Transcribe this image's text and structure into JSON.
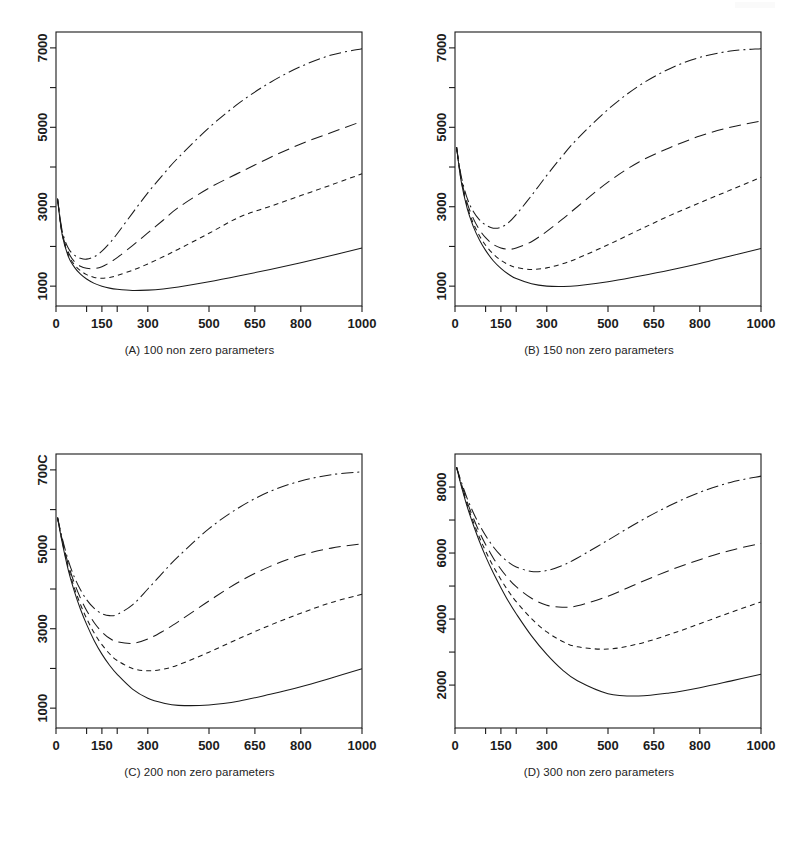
{
  "figure": {
    "title": "",
    "panel_count": 4,
    "background_color": "#ffffff",
    "line_color": "#1a1a1a"
  },
  "captions": {
    "a": "(A) 100 non zero parameters",
    "b": "(B) 150 non zero parameters",
    "c": "(C) 200 non zero parameters",
    "d": "(D) 300 non zero parameters"
  },
  "chart_data": [
    {
      "id": "panel-a",
      "type": "line",
      "title": "(A) 100 non zero parameters",
      "xlabel": "",
      "ylabel": "",
      "xlim": [
        0,
        1000
      ],
      "ylim": [
        500,
        7400
      ],
      "grid": false,
      "legend": "none",
      "xticks": [
        0,
        100,
        150,
        200,
        300,
        500,
        650,
        800,
        1000
      ],
      "xtick_labels": [
        "0",
        "",
        "150",
        "",
        "300",
        "500",
        "650",
        "800",
        "1000"
      ],
      "yticks": [
        1000,
        2000,
        3000,
        4000,
        5000,
        6000,
        7000
      ],
      "ytick_labels": [
        "1000",
        "",
        "3000",
        "",
        "5000",
        "",
        "7000"
      ],
      "series": [
        {
          "name": "solid",
          "style": "solid",
          "x": [
            5,
            20,
            40,
            60,
            80,
            100,
            125,
            150,
            175,
            200,
            250,
            300,
            350,
            400,
            500,
            600,
            700,
            800,
            900,
            1000
          ],
          "y": [
            3200,
            2300,
            1750,
            1480,
            1300,
            1180,
            1070,
            1000,
            950,
            920,
            890,
            900,
            930,
            980,
            1110,
            1260,
            1420,
            1590,
            1770,
            1960
          ]
        },
        {
          "name": "short-dash",
          "style": "short-dash",
          "x": [
            5,
            20,
            40,
            60,
            80,
            100,
            125,
            150,
            175,
            200,
            250,
            300,
            350,
            400,
            500,
            600,
            700,
            800,
            900,
            1000
          ],
          "y": [
            3200,
            2320,
            1800,
            1540,
            1390,
            1290,
            1220,
            1200,
            1220,
            1270,
            1400,
            1560,
            1740,
            1930,
            2330,
            2740,
            3010,
            3280,
            3550,
            3830
          ]
        },
        {
          "name": "long-dash",
          "style": "long-dash",
          "x": [
            5,
            20,
            40,
            60,
            80,
            100,
            125,
            150,
            175,
            200,
            250,
            300,
            350,
            400,
            500,
            600,
            700,
            800,
            900,
            1000
          ],
          "y": [
            3200,
            2350,
            1860,
            1620,
            1500,
            1450,
            1440,
            1490,
            1590,
            1720,
            2020,
            2340,
            2660,
            2980,
            3470,
            3860,
            4240,
            4580,
            4870,
            5150
          ]
        },
        {
          "name": "dash-dot",
          "style": "dash-dot",
          "x": [
            5,
            20,
            40,
            60,
            80,
            100,
            125,
            150,
            175,
            200,
            250,
            300,
            350,
            400,
            500,
            600,
            700,
            800,
            900,
            1000
          ],
          "y": [
            3200,
            2400,
            1960,
            1780,
            1700,
            1680,
            1740,
            1880,
            2080,
            2320,
            2840,
            3350,
            3810,
            4240,
            4990,
            5620,
            6130,
            6530,
            6820,
            6980
          ]
        }
      ]
    },
    {
      "id": "panel-b",
      "type": "line",
      "title": "(B) 150 non zero parameters",
      "xlabel": "",
      "ylabel": "",
      "xlim": [
        0,
        1000
      ],
      "ylim": [
        500,
        7400
      ],
      "grid": false,
      "legend": "none",
      "xticks": [
        0,
        100,
        150,
        200,
        300,
        500,
        650,
        800,
        1000
      ],
      "xtick_labels": [
        "0",
        "",
        "150",
        "",
        "300",
        "500",
        "650",
        "800",
        "1000"
      ],
      "yticks": [
        1000,
        2000,
        3000,
        4000,
        5000,
        6000,
        7000
      ],
      "ytick_labels": [
        "1000",
        "",
        "3000",
        "",
        "5000",
        "",
        "7000"
      ],
      "series": [
        {
          "name": "solid",
          "style": "solid",
          "x": [
            5,
            20,
            40,
            60,
            80,
            100,
            125,
            150,
            175,
            200,
            250,
            300,
            350,
            400,
            500,
            600,
            700,
            800,
            900,
            1000
          ],
          "y": [
            4500,
            3650,
            2950,
            2500,
            2160,
            1900,
            1640,
            1450,
            1300,
            1190,
            1060,
            1000,
            990,
            1010,
            1110,
            1250,
            1400,
            1570,
            1760,
            1950
          ]
        },
        {
          "name": "short-dash",
          "style": "short-dash",
          "x": [
            5,
            20,
            40,
            60,
            80,
            100,
            125,
            150,
            175,
            200,
            250,
            300,
            350,
            400,
            500,
            600,
            700,
            800,
            900,
            1000
          ],
          "y": [
            4500,
            3680,
            3010,
            2580,
            2270,
            2030,
            1810,
            1650,
            1540,
            1470,
            1420,
            1460,
            1560,
            1700,
            2040,
            2410,
            2770,
            3100,
            3420,
            3740
          ]
        },
        {
          "name": "long-dash",
          "style": "long-dash",
          "x": [
            5,
            20,
            40,
            60,
            80,
            100,
            125,
            150,
            175,
            200,
            250,
            300,
            350,
            400,
            500,
            600,
            700,
            800,
            900,
            1000
          ],
          "y": [
            4500,
            3720,
            3090,
            2700,
            2420,
            2220,
            2050,
            1960,
            1930,
            1960,
            2120,
            2380,
            2680,
            3000,
            3620,
            4120,
            4480,
            4780,
            5000,
            5160
          ]
        },
        {
          "name": "dash-dot",
          "style": "dash-dot",
          "x": [
            5,
            20,
            40,
            60,
            80,
            100,
            125,
            150,
            175,
            200,
            250,
            300,
            350,
            400,
            500,
            600,
            700,
            800,
            900,
            1000
          ],
          "y": [
            4500,
            3780,
            3210,
            2880,
            2670,
            2540,
            2460,
            2480,
            2600,
            2800,
            3280,
            3790,
            4270,
            4710,
            5450,
            6040,
            6470,
            6760,
            6920,
            6980
          ]
        }
      ]
    },
    {
      "id": "panel-c",
      "type": "line",
      "title": "(C) 200 non zero parameters",
      "xlabel": "",
      "ylabel": "",
      "xlim": [
        0,
        1000
      ],
      "ylim": [
        500,
        7400
      ],
      "grid": false,
      "legend": "none",
      "xticks": [
        0,
        100,
        150,
        200,
        300,
        500,
        650,
        800,
        1000
      ],
      "xtick_labels": [
        "0",
        "",
        "150",
        "",
        "300",
        "500",
        "650",
        "800",
        "1000"
      ],
      "yticks": [
        1000,
        2000,
        3000,
        4000,
        5000,
        6000,
        7000
      ],
      "ytick_labels": [
        "1000",
        "",
        "3000",
        "",
        "5000",
        "",
        "700C"
      ],
      "series": [
        {
          "name": "solid",
          "style": "solid",
          "x": [
            5,
            20,
            40,
            60,
            80,
            100,
            125,
            150,
            175,
            200,
            250,
            300,
            350,
            400,
            500,
            600,
            700,
            800,
            900,
            1000
          ],
          "y": [
            5800,
            5180,
            4480,
            3940,
            3490,
            3110,
            2700,
            2360,
            2080,
            1850,
            1480,
            1250,
            1130,
            1070,
            1080,
            1180,
            1350,
            1540,
            1760,
            1990
          ]
        },
        {
          "name": "short-dash",
          "style": "short-dash",
          "x": [
            5,
            20,
            40,
            60,
            80,
            100,
            125,
            150,
            175,
            200,
            250,
            300,
            350,
            400,
            500,
            600,
            700,
            800,
            900,
            1000
          ],
          "y": [
            5800,
            5210,
            4540,
            4030,
            3610,
            3260,
            2890,
            2600,
            2370,
            2200,
            2000,
            1940,
            1980,
            2090,
            2410,
            2760,
            3090,
            3390,
            3660,
            3870
          ]
        },
        {
          "name": "long-dash",
          "style": "long-dash",
          "x": [
            5,
            20,
            40,
            60,
            80,
            100,
            125,
            150,
            175,
            200,
            250,
            300,
            350,
            400,
            500,
            600,
            700,
            800,
            900,
            1000
          ],
          "y": [
            5800,
            5250,
            4620,
            4150,
            3770,
            3460,
            3150,
            2920,
            2760,
            2670,
            2630,
            2740,
            2940,
            3180,
            3700,
            4190,
            4570,
            4850,
            5030,
            5140
          ]
        },
        {
          "name": "dash-dot",
          "style": "dash-dot",
          "x": [
            5,
            20,
            40,
            60,
            80,
            100,
            125,
            150,
            175,
            200,
            250,
            300,
            350,
            400,
            500,
            600,
            700,
            800,
            900,
            1000
          ],
          "y": [
            5800,
            5290,
            4720,
            4300,
            3980,
            3730,
            3510,
            3380,
            3330,
            3360,
            3600,
            4000,
            4420,
            4820,
            5520,
            6060,
            6460,
            6720,
            6880,
            6950
          ]
        }
      ]
    },
    {
      "id": "panel-d",
      "type": "line",
      "title": "(D) 300 non zero parameters",
      "xlabel": "",
      "ylabel": "",
      "xlim": [
        0,
        1000
      ],
      "ylim": [
        700,
        9000
      ],
      "grid": false,
      "legend": "none",
      "xticks": [
        0,
        100,
        150,
        200,
        300,
        500,
        650,
        800,
        1000
      ],
      "xtick_labels": [
        "0",
        "",
        "150",
        "",
        "300",
        "500",
        "650",
        "800",
        "1000"
      ],
      "yticks": [
        2000,
        3000,
        4000,
        5000,
        6000,
        7000,
        8000
      ],
      "ytick_labels": [
        "2000",
        "",
        "4000",
        "",
        "6000",
        "",
        "8000"
      ],
      "series": [
        {
          "name": "solid",
          "style": "solid",
          "x": [
            5,
            20,
            40,
            60,
            80,
            100,
            125,
            150,
            175,
            200,
            250,
            300,
            350,
            400,
            500,
            600,
            700,
            800,
            900,
            1000
          ],
          "y": [
            8600,
            8050,
            7400,
            6850,
            6350,
            5900,
            5400,
            4950,
            4530,
            4160,
            3490,
            2930,
            2470,
            2130,
            1740,
            1670,
            1760,
            1920,
            2120,
            2330
          ]
        },
        {
          "name": "short-dash",
          "style": "short-dash",
          "x": [
            5,
            20,
            40,
            60,
            80,
            100,
            125,
            150,
            175,
            200,
            250,
            300,
            350,
            400,
            500,
            600,
            700,
            800,
            900,
            1000
          ],
          "y": [
            8600,
            8080,
            7460,
            6940,
            6470,
            6060,
            5600,
            5200,
            4840,
            4530,
            4010,
            3610,
            3330,
            3160,
            3090,
            3250,
            3530,
            3860,
            4200,
            4520
          ]
        },
        {
          "name": "long-dash",
          "style": "long-dash",
          "x": [
            5,
            20,
            40,
            60,
            80,
            100,
            125,
            150,
            175,
            200,
            250,
            300,
            350,
            400,
            500,
            600,
            700,
            800,
            900,
            1000
          ],
          "y": [
            8600,
            8120,
            7540,
            7060,
            6630,
            6260,
            5850,
            5510,
            5220,
            4980,
            4630,
            4420,
            4360,
            4400,
            4690,
            5090,
            5470,
            5800,
            6080,
            6290
          ]
        },
        {
          "name": "dash-dot",
          "style": "dash-dot",
          "x": [
            5,
            20,
            40,
            60,
            80,
            100,
            125,
            150,
            175,
            200,
            250,
            300,
            350,
            400,
            500,
            600,
            700,
            800,
            900,
            1000
          ],
          "y": [
            8600,
            8170,
            7650,
            7220,
            6850,
            6530,
            6190,
            5920,
            5720,
            5580,
            5440,
            5470,
            5620,
            5850,
            6390,
            6940,
            7430,
            7840,
            8140,
            8330
          ]
        }
      ]
    }
  ]
}
